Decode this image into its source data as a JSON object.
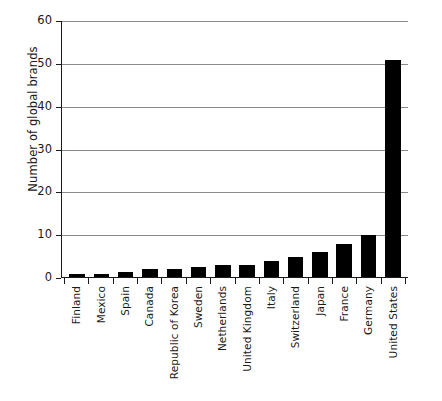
{
  "chart_data": {
    "type": "bar",
    "title": "",
    "xlabel": "",
    "ylabel": "Number of global brands",
    "ylim": [
      0,
      60
    ],
    "yticks": [
      0,
      10,
      20,
      30,
      40,
      50,
      60
    ],
    "grid": true,
    "legend": "none",
    "bar_color": "#000000",
    "categories": [
      "Finland",
      "Mexico",
      "Spain",
      "Canada",
      "Republic of Korea",
      "Sweden",
      "Netherlands",
      "United Kingdom",
      "Italy",
      "Switzerland",
      "Japan",
      "France",
      "Germany",
      "United States"
    ],
    "values": [
      1,
      1,
      1.5,
      2,
      2,
      2.5,
      3,
      3,
      4,
      5,
      6,
      8,
      10,
      51
    ]
  }
}
